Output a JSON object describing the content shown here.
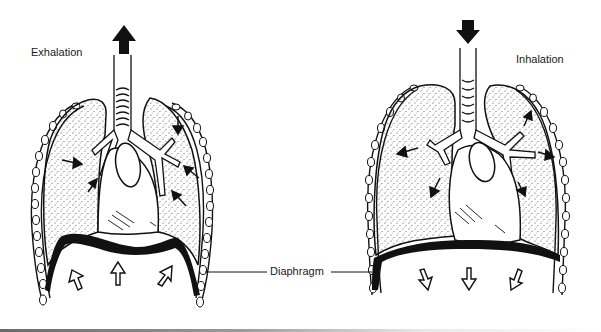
{
  "figure": {
    "panels": [
      {
        "id": "exhalation",
        "label": "Exhalation",
        "airflow": "up",
        "diaphragm_motion": "up"
      },
      {
        "id": "inhalation",
        "label": "Inhalation",
        "airflow": "down",
        "diaphragm_motion": "down"
      }
    ],
    "callout": {
      "label": "Diaphragm"
    },
    "colors": {
      "ink": "#111111",
      "background": "#ffffff",
      "stipple": "#444444"
    }
  }
}
